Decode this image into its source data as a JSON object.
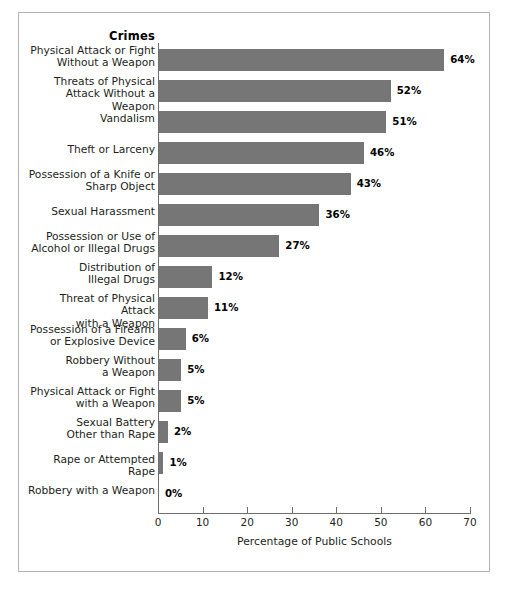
{
  "figure": {
    "category_header": "Crimes",
    "bar_color": "#767676",
    "axis_color": "#6e6e6e",
    "frame_color": "#b3b3b3",
    "background": "#ffffff"
  },
  "chart_data": {
    "type": "bar",
    "orientation": "horizontal",
    "title": "",
    "subtitle": "",
    "xlabel": "Percentage of Public Schools",
    "ylabel": "Crimes",
    "xlim": [
      0,
      70
    ],
    "xticks": [
      0,
      10,
      20,
      30,
      40,
      50,
      60,
      70
    ],
    "xtick_labels": [
      "0",
      "10",
      "20",
      "30",
      "40",
      "50",
      "60",
      "70"
    ],
    "grid": false,
    "legend": null,
    "value_label_suffix": "%",
    "categories": [
      "Physical Attack or Fight\nWithout a Weapon",
      "Threats of Physical\nAttack Without a Weapon",
      "Vandalism",
      "Theft or Larceny",
      "Possession of a Knife or\nSharp Object",
      "Sexual Harassment",
      "Possession or Use of\nAlcohol or Illegal Drugs",
      "Distribution of\nIllegal Drugs",
      "Threat of Physical Attack\nwith a Weapon",
      "Possession of a Firearm\nor Explosive Device",
      "Robbery Without\na Weapon",
      "Physical Attack or Fight\nwith a Weapon",
      "Sexual Battery\nOther than Rape",
      "Rape or Attempted Rape",
      "Robbery with a Weapon"
    ],
    "values": [
      64,
      52,
      51,
      46,
      43,
      36,
      27,
      12,
      11,
      6,
      5,
      5,
      2,
      1,
      0
    ],
    "value_labels": [
      "64%",
      "52%",
      "51%",
      "46%",
      "43%",
      "36%",
      "27%",
      "12%",
      "11%",
      "6%",
      "5%",
      "5%",
      "2%",
      "1%",
      "0%"
    ]
  }
}
